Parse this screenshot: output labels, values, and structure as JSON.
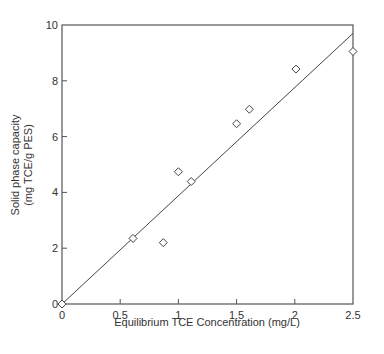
{
  "chart_data": {
    "type": "scatter",
    "title": "",
    "xlabel": "Equilibrium TCE Concentration (mg/L)",
    "ylabel_line1": "Solid phase capacity",
    "ylabel_line2": "(mg TCE/g PES)",
    "xlim": [
      0,
      2.5
    ],
    "ylim": [
      0,
      10
    ],
    "x_ticks": [
      0,
      0.5,
      1,
      1.5,
      2,
      2.5
    ],
    "x_tick_labels": [
      "0",
      "0.5",
      "1",
      "1.5",
      "2",
      "2.5"
    ],
    "y_ticks": [
      0,
      2,
      4,
      6,
      8,
      10
    ],
    "y_tick_labels": [
      "0",
      "2",
      "4",
      "6",
      "8",
      "10"
    ],
    "grid": false,
    "legend": null,
    "series": [
      {
        "name": "Measured",
        "marker": "open-diamond",
        "points": [
          {
            "x": 0.0,
            "y": 0.0
          },
          {
            "x": 0.61,
            "y": 2.35
          },
          {
            "x": 0.87,
            "y": 2.2
          },
          {
            "x": 1.0,
            "y": 4.74
          },
          {
            "x": 1.11,
            "y": 4.39
          },
          {
            "x": 1.5,
            "y": 6.46
          },
          {
            "x": 1.61,
            "y": 6.98
          },
          {
            "x": 2.01,
            "y": 8.42
          },
          {
            "x": 2.5,
            "y": 9.05
          }
        ]
      },
      {
        "name": "Linear fit",
        "style": "line",
        "points": [
          {
            "x": 0.0,
            "y": 0.0
          },
          {
            "x": 2.5,
            "y": 9.7
          }
        ]
      }
    ],
    "colors": {
      "axis": "#555555",
      "marker": "#444444",
      "line": "#444444"
    }
  }
}
